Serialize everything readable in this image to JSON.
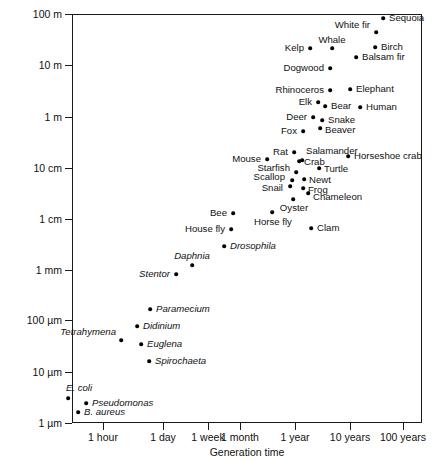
{
  "chart_data": {
    "type": "scatter",
    "title": "",
    "xlabel": "Generation time",
    "ylabel": "Length",
    "xscale": "log",
    "yscale": "log",
    "grid": false,
    "legend": "none",
    "xticks": [
      {
        "label": "1 hour",
        "px": 103
      },
      {
        "label": "1 day",
        "px": 163
      },
      {
        "label": "1 week",
        "px": 208
      },
      {
        "label": "1 month",
        "px": 240
      },
      {
        "label": "1 year",
        "px": 295
      },
      {
        "label": "10 years",
        "px": 350
      },
      {
        "label": "100 years",
        "px": 403
      }
    ],
    "yticks": [
      {
        "label": "100 m",
        "px": 14
      },
      {
        "label": "10 m",
        "px": 65
      },
      {
        "label": "1 m",
        "px": 117
      },
      {
        "label": "10 cm",
        "px": 168
      },
      {
        "label": "1 cm",
        "px": 219
      },
      {
        "label": "1 mm",
        "px": 270
      },
      {
        "label": "100 µm",
        "px": 320
      },
      {
        "label": "10 µm",
        "px": 372
      },
      {
        "label": "1 µm",
        "px": 423
      }
    ],
    "points": [
      {
        "name": "Sequoia",
        "x": 383,
        "y": 18,
        "lx": 389,
        "ly": 18,
        "side": "rgt",
        "italic": false
      },
      {
        "name": "White fir",
        "x": 376,
        "y": 32,
        "lx": 370,
        "ly": 25,
        "side": "lft",
        "italic": false
      },
      {
        "name": "Whale",
        "x": 332,
        "y": 48,
        "lx": 332,
        "ly": 40,
        "side": "ctr",
        "italic": false
      },
      {
        "name": "Birch",
        "x": 375,
        "y": 47,
        "lx": 381,
        "ly": 47,
        "side": "rgt",
        "italic": false
      },
      {
        "name": "Kelp",
        "x": 310,
        "y": 48,
        "lx": 304,
        "ly": 48,
        "side": "lft",
        "italic": false
      },
      {
        "name": "Balsam fir",
        "x": 356,
        "y": 57,
        "lx": 362,
        "ly": 57,
        "side": "rgt",
        "italic": false
      },
      {
        "name": "Dogwood",
        "x": 330,
        "y": 68,
        "lx": 324,
        "ly": 68,
        "side": "lft",
        "italic": false
      },
      {
        "name": "Rhinoceros",
        "x": 330,
        "y": 90,
        "lx": 324,
        "ly": 90,
        "side": "lft",
        "italic": false
      },
      {
        "name": "Elephant",
        "x": 350,
        "y": 89,
        "lx": 356,
        "ly": 89,
        "side": "rgt",
        "italic": false
      },
      {
        "name": "Elk",
        "x": 318,
        "y": 102,
        "lx": 312,
        "ly": 102,
        "side": "lft",
        "italic": false
      },
      {
        "name": "Bear",
        "x": 325,
        "y": 106,
        "lx": 331,
        "ly": 106,
        "side": "rgt",
        "italic": false
      },
      {
        "name": "Human",
        "x": 360,
        "y": 107,
        "lx": 366,
        "ly": 107,
        "side": "rgt",
        "italic": false
      },
      {
        "name": "Deer",
        "x": 313,
        "y": 117,
        "lx": 307,
        "ly": 117,
        "side": "lft",
        "italic": false
      },
      {
        "name": "Snake",
        "x": 322,
        "y": 120,
        "lx": 328,
        "ly": 120,
        "side": "rgt",
        "italic": false
      },
      {
        "name": "Fox",
        "x": 303,
        "y": 131,
        "lx": 297,
        "ly": 131,
        "side": "lft",
        "italic": false
      },
      {
        "name": "Beaver",
        "x": 320,
        "y": 128,
        "lx": 325,
        "ly": 130,
        "side": "rgt",
        "italic": false
      },
      {
        "name": "Rat",
        "x": 294,
        "y": 152,
        "lx": 288,
        "ly": 152,
        "side": "lft",
        "italic": false
      },
      {
        "name": "Salamander",
        "x": 302,
        "y": 160,
        "lx": 306,
        "ly": 151,
        "side": "rgt",
        "italic": false
      },
      {
        "name": "Mouse",
        "x": 267,
        "y": 159,
        "lx": 261,
        "ly": 159,
        "side": "lft",
        "italic": false
      },
      {
        "name": "Horseshoe crab",
        "x": 348,
        "y": 156,
        "lx": 354,
        "ly": 156,
        "side": "rgt",
        "italic": false
      },
      {
        "name": "Crab",
        "x": 299,
        "y": 161,
        "lx": 304,
        "ly": 162,
        "side": "rgt",
        "italic": false
      },
      {
        "name": "Starfish",
        "x": 296,
        "y": 172,
        "lx": 290,
        "ly": 168,
        "side": "lft",
        "italic": false
      },
      {
        "name": "Turtle",
        "x": 319,
        "y": 168,
        "lx": 324,
        "ly": 169,
        "side": "rgt",
        "italic": false
      },
      {
        "name": "Scallop",
        "x": 292,
        "y": 180,
        "lx": 285,
        "ly": 177,
        "side": "lft",
        "italic": false
      },
      {
        "name": "Newt",
        "x": 304,
        "y": 179,
        "lx": 309,
        "ly": 180,
        "side": "rgt",
        "italic": false
      },
      {
        "name": "Snail",
        "x": 290,
        "y": 186,
        "lx": 283,
        "ly": 188,
        "side": "lft",
        "italic": false
      },
      {
        "name": "Frog",
        "x": 303,
        "y": 188,
        "lx": 308,
        "ly": 190,
        "side": "rgt",
        "italic": false
      },
      {
        "name": "Chameleon",
        "x": 308,
        "y": 193,
        "lx": 313,
        "ly": 197,
        "side": "rgt",
        "italic": false
      },
      {
        "name": "Oyster",
        "x": 293,
        "y": 199,
        "lx": 294,
        "ly": 208,
        "side": "ctr",
        "italic": false
      },
      {
        "name": "Bee",
        "x": 233,
        "y": 213,
        "lx": 227,
        "ly": 213,
        "side": "lft",
        "italic": false
      },
      {
        "name": "Horse fly",
        "x": 272,
        "y": 212,
        "lx": 273,
        "ly": 222,
        "side": "ctr",
        "italic": false
      },
      {
        "name": "Clam",
        "x": 311,
        "y": 228,
        "lx": 317,
        "ly": 228,
        "side": "rgt",
        "italic": false
      },
      {
        "name": "House fly",
        "x": 231,
        "y": 229,
        "lx": 225,
        "ly": 229,
        "side": "lft",
        "italic": false
      },
      {
        "name": "Drosophila",
        "x": 224,
        "y": 246,
        "lx": 230,
        "ly": 246,
        "side": "rgt",
        "italic": true
      },
      {
        "name": "Daphnia",
        "x": 192,
        "y": 265,
        "lx": 192,
        "ly": 256,
        "side": "ctr",
        "italic": true
      },
      {
        "name": "Stentor",
        "x": 176,
        "y": 274,
        "lx": 170,
        "ly": 274,
        "side": "lft",
        "italic": true
      },
      {
        "name": "Paramecium",
        "x": 150,
        "y": 309,
        "lx": 156,
        "ly": 309,
        "side": "rgt",
        "italic": true
      },
      {
        "name": "Didinium",
        "x": 137,
        "y": 326,
        "lx": 143,
        "ly": 326,
        "side": "rgt",
        "italic": true
      },
      {
        "name": "Tetrahymena",
        "x": 121,
        "y": 340,
        "lx": 116,
        "ly": 332,
        "side": "lft",
        "italic": true
      },
      {
        "name": "Euglena",
        "x": 141,
        "y": 344,
        "lx": 147,
        "ly": 344,
        "side": "rgt",
        "italic": true
      },
      {
        "name": "Spirochaeta",
        "x": 149,
        "y": 361,
        "lx": 155,
        "ly": 361,
        "side": "rgt",
        "italic": true
      },
      {
        "name": "E. coli",
        "x": 68,
        "y": 398,
        "lx": 66,
        "ly": 388,
        "side": "rgt",
        "italic": true
      },
      {
        "name": "Pseudomonas",
        "x": 86,
        "y": 403,
        "lx": 92,
        "ly": 403,
        "side": "rgt",
        "italic": true
      },
      {
        "name": "B. aureus",
        "x": 78,
        "y": 412,
        "lx": 84,
        "ly": 412,
        "side": "rgt",
        "italic": true
      }
    ]
  }
}
